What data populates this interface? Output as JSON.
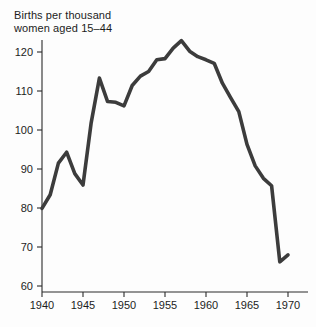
{
  "chart_data": {
    "type": "line",
    "title_line1": "Births per thousand",
    "title_line2": "women aged 15–44",
    "xlabel": "",
    "ylabel": "",
    "ylim": [
      55,
      126
    ],
    "xlim": [
      1940,
      1971
    ],
    "grid": false,
    "legend": false,
    "line_color": "#3c3c3c",
    "axis_color": "#2b2b2b",
    "background_color": "#fdfdfd",
    "y_ticks": [
      60,
      70,
      80,
      90,
      100,
      110,
      120
    ],
    "y_tick_labels": [
      "60",
      "70",
      "80",
      "90",
      "100",
      "110",
      "120"
    ],
    "x_ticks": [
      1940,
      1945,
      1950,
      1955,
      1960,
      1965,
      1970
    ],
    "x_tick_labels": [
      "1940",
      "1945",
      "1950",
      "1955",
      "1960",
      "1965",
      "1970"
    ],
    "x": [
      1940,
      1941,
      1942,
      1943,
      1944,
      1945,
      1946,
      1947,
      1948,
      1949,
      1950,
      1951,
      1952,
      1953,
      1954,
      1955,
      1956,
      1957,
      1958,
      1959,
      1960,
      1961,
      1962,
      1963,
      1964,
      1965,
      1966,
      1967,
      1968,
      1969,
      1970
    ],
    "values": [
      79.9,
      83.4,
      91.5,
      94.3,
      88.8,
      85.9,
      101.9,
      113.3,
      107.3,
      107.1,
      106.2,
      111.4,
      113.8,
      115.0,
      118.0,
      118.3,
      121.0,
      122.9,
      120.2,
      118.8,
      118.0,
      117.1,
      112.0,
      108.3,
      104.7,
      96.3,
      90.8,
      87.6,
      85.7,
      66.2,
      68.0
    ],
    "series": [
      {
        "name": "Births per thousand women aged 15–44",
        "values": [
          79.9,
          83.4,
          91.5,
          94.3,
          88.8,
          85.9,
          101.9,
          113.3,
          107.3,
          107.1,
          106.2,
          111.4,
          113.8,
          115.0,
          118.0,
          118.3,
          121.0,
          122.9,
          120.2,
          118.8,
          118.0,
          117.1,
          112.0,
          108.3,
          104.7,
          96.3,
          90.8,
          87.6,
          85.7,
          66.2,
          68.0
        ]
      }
    ],
    "annotations": []
  }
}
